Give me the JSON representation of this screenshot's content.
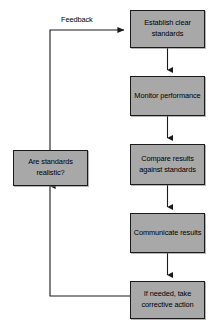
{
  "diagram": {
    "background_color": "#ffffff",
    "node_fill_color": "#a8a8a8",
    "node_border_color": "#1a1a1a",
    "connector_color": "#1a1a1a",
    "nodes": [
      {
        "id": "establish",
        "label": "Establish clear standards"
      },
      {
        "id": "monitor",
        "label": "Monitor performance"
      },
      {
        "id": "compare",
        "label": "Compare results against standards"
      },
      {
        "id": "communicate",
        "label": "Communicate results"
      },
      {
        "id": "corrective",
        "label": "If needed, take corrective action"
      },
      {
        "id": "realistic",
        "label": "Are standards realistic?"
      }
    ],
    "edge_labels": [
      {
        "id": "feedback",
        "label": "Feedback"
      }
    ]
  }
}
